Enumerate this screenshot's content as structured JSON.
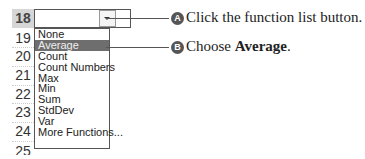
{
  "spreadsheet": {
    "row_headers": [
      "18",
      "19",
      "20",
      "21",
      "22",
      "23",
      "24",
      "25"
    ],
    "selected_row": "18"
  },
  "function_list": {
    "button_icon": "dropdown-arrow-icon",
    "items": [
      "None",
      "Average",
      "Count",
      "Count Numbers",
      "Max",
      "Min",
      "Sum",
      "StdDev",
      "Var",
      "More Functions..."
    ],
    "highlighted": "Average"
  },
  "callouts": [
    {
      "badge": "A",
      "text": "Click the function list button."
    },
    {
      "badge": "B",
      "prefix": "Choose ",
      "bold": "Average",
      "suffix": "."
    }
  ],
  "colors": {
    "highlight": "#6e6e6e",
    "row_header_selected": "#d6d6d6",
    "badge": "#555555"
  }
}
